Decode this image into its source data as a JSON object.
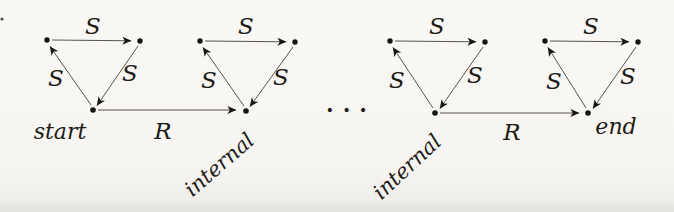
{
  "figure": {
    "colors": {
      "paper": "#f6f5f1",
      "ink": "#1d1b16"
    },
    "triangles": [
      {
        "node_label": "start",
        "edge_top": "S",
        "edge_left": "S",
        "edge_right": "S"
      },
      {
        "node_label": "internal",
        "edge_top": "S",
        "edge_left": "S",
        "edge_right": "S"
      },
      {
        "node_label": "internal",
        "edge_top": "S",
        "edge_left": "S",
        "edge_right": "S"
      },
      {
        "node_label": "end",
        "edge_top": "S",
        "edge_left": "S",
        "edge_right": "S"
      }
    ],
    "relations": [
      {
        "label": "R"
      },
      {
        "label": "R"
      }
    ],
    "ellipsis": "..."
  }
}
